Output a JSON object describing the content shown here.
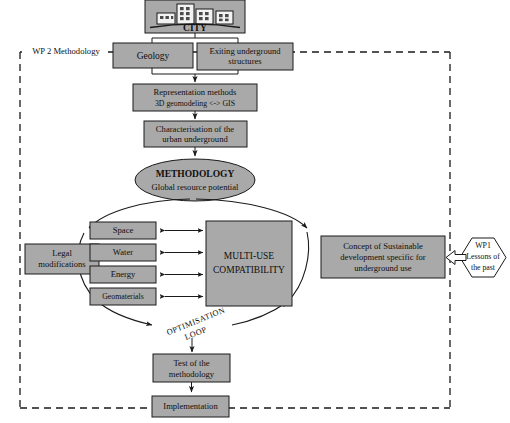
{
  "diagram": {
    "title": "WP 2 Methodology",
    "boundary_label": "WP 2 Methodology",
    "colors": {
      "box_fill": "#a9a9a9",
      "stroke": "#1a1a1a",
      "background": "#ffffff",
      "white_fill": "#ffffff"
    }
  },
  "nodes": {
    "city": {
      "label": "CITY",
      "icon": "city-skyline-icon"
    },
    "geology": {
      "label": "Geology"
    },
    "existing_structures": {
      "line1": "Exiting underground",
      "line2": "structures"
    },
    "representation": {
      "line1": "Representation methods",
      "line2": "3D geomodeling <-> GIS"
    },
    "characterisation": {
      "line1": "Characterisation of the",
      "line2": "urban underground"
    },
    "methodology": {
      "line1": "METHODOLOGY",
      "line2": "Global resource potential"
    },
    "legal": {
      "line1": "Legal",
      "line2": "modifications"
    },
    "resources": [
      {
        "label": "Space"
      },
      {
        "label": "Water"
      },
      {
        "label": "Energy"
      },
      {
        "label": "Geomaterials"
      }
    ],
    "multi_use": {
      "line1": "MULTI-USE",
      "line2": "COMPATIBILITY"
    },
    "concept": {
      "line1": "Concept of Sustainable",
      "line2": "development specific for",
      "line3": "underground use"
    },
    "wp1": {
      "line1": "WP1",
      "line2": "Lessons of",
      "line3": "the past"
    },
    "test": {
      "line1": "Test of the",
      "line2": "methodology"
    },
    "implementation": {
      "label": "Implementation"
    },
    "optimisation_loop": {
      "line1": "OPTIMISATION",
      "line2": "LOOP"
    }
  }
}
